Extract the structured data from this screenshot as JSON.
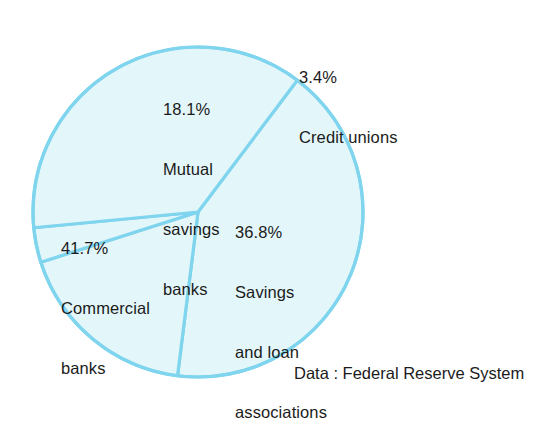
{
  "chart_data": {
    "type": "pie",
    "title": "",
    "subtitle": "",
    "xlabel": "",
    "ylabel": "",
    "legend_position": "none",
    "grid": false,
    "units": "percent",
    "categories": [
      "Commercial banks",
      "Mutual savings banks",
      "Credit unions",
      "Savings and loan associations"
    ],
    "values": [
      41.7,
      18.1,
      3.4,
      36.8
    ],
    "slices": [
      {
        "label": "Commercial banks",
        "value": 41.7,
        "value_text": "41.7%",
        "name_lines": [
          "Commercial",
          "banks"
        ],
        "start_angle_deg": -53.0,
        "sweep_deg": 150.1,
        "fill": "#e3f6fa",
        "stroke": "#7fd4ee"
      },
      {
        "label": "Mutual savings banks",
        "value": 18.1,
        "value_text": "18.1%",
        "name_lines": [
          "Mutual",
          "savings",
          "banks"
        ],
        "start_angle_deg": -53.0,
        "sweep_deg": -65.2,
        "fill": "#e3f6fa",
        "stroke": "#7fd4ee"
      },
      {
        "label": "Credit unions",
        "value": 3.4,
        "value_text": "3.4%",
        "name_lines": [
          "Credit unions"
        ],
        "start_angle_deg": -118.2,
        "sweep_deg": -12.2,
        "fill": "#e3f6fa",
        "stroke": "#7fd4ee"
      },
      {
        "label": "Savings and loan associations",
        "value": 36.8,
        "value_text": "36.8%",
        "name_lines": [
          "Savings",
          "and loan",
          "associations"
        ],
        "start_angle_deg": -130.4,
        "sweep_deg": -132.5,
        "fill": "#e3f6fa",
        "stroke": "#7fd4ee"
      }
    ],
    "geometry": {
      "center_x": 198,
      "center_y": 212,
      "radius": 165,
      "stroke_width": 3.2
    },
    "colors": {
      "slice_fill": "#e3f6fa",
      "slice_stroke": "#7fd4ee",
      "text": "#1b1b1b",
      "background": "#ffffff"
    },
    "source_note": "Data : Federal Reserve System"
  },
  "labels": {
    "commercial": {
      "pct": "41.7%",
      "line1": "Commercial",
      "line2": "banks"
    },
    "mutual": {
      "pct": "18.1%",
      "line1": "Mutual",
      "line2": "savings",
      "line3": "banks"
    },
    "credit": {
      "pct": "3.4%",
      "line1": "Credit unions"
    },
    "savings_loan": {
      "pct": "36.8%",
      "line1": "Savings",
      "line2": "and loan",
      "line3": "associations"
    }
  },
  "footer": {
    "source": "Data : Federal Reserve System"
  }
}
